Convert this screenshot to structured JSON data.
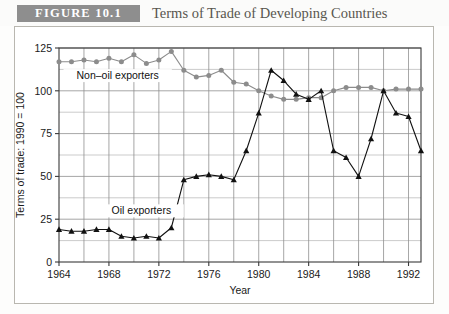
{
  "header": {
    "badge": "FIGURE 10.1",
    "title": "Terms of Trade of Developing Countries",
    "badge_color": "#8e8e8e",
    "title_color": "#58564f"
  },
  "chart_data": {
    "type": "line",
    "title": "Terms of Trade of Developing Countries",
    "xlabel": "Year",
    "ylabel": "Terms of trade: 1990 = 100",
    "xlim": [
      1964,
      1993
    ],
    "ylim": [
      0,
      125
    ],
    "yticks": [
      0,
      25,
      50,
      75,
      100,
      125
    ],
    "ytick_labels": [
      "0",
      "25",
      "50",
      "75",
      "100",
      "125"
    ],
    "xticks": [
      1964,
      1968,
      1972,
      1976,
      1980,
      1984,
      1988,
      1992
    ],
    "xtick_labels": [
      "1964",
      "1968",
      "1972",
      "1976",
      "1980",
      "1984",
      "1988",
      "1992"
    ],
    "x_minor_step": 2,
    "y_minor_step": 12.5,
    "grid": true,
    "legend": "inline-annotations",
    "x": [
      1964,
      1965,
      1966,
      1967,
      1968,
      1969,
      1970,
      1971,
      1972,
      1973,
      1974,
      1975,
      1976,
      1977,
      1978,
      1979,
      1980,
      1981,
      1982,
      1983,
      1984,
      1985,
      1986,
      1987,
      1988,
      1989,
      1990,
      1991,
      1992,
      1993
    ],
    "series": [
      {
        "name": "Non-oil exporters",
        "label": "Non–oil exporters",
        "color": "#8c8c8c",
        "marker": "circle",
        "values": [
          117,
          117,
          118,
          117,
          119,
          117,
          121,
          116,
          118,
          123,
          112,
          108,
          109,
          112,
          105,
          104,
          100,
          97,
          95,
          95,
          96,
          96,
          100,
          102,
          102,
          102,
          100,
          101,
          101,
          101
        ]
      },
      {
        "name": "Oil exporters",
        "label": "Oil exporters",
        "color": "#111111",
        "marker": "triangle",
        "values": [
          19,
          18,
          18,
          19,
          19,
          15,
          14,
          15,
          14,
          20,
          48,
          50,
          51,
          50,
          48,
          65,
          87,
          112,
          106,
          98,
          95,
          100,
          65,
          61,
          50,
          72,
          100,
          87,
          85,
          65
        ]
      }
    ],
    "annotations": [
      {
        "text": "Non–oil exporters",
        "x": 1968.7,
        "y": 108
      },
      {
        "text": "Oil exporters",
        "x": 1970.6,
        "y": 29
      }
    ]
  }
}
